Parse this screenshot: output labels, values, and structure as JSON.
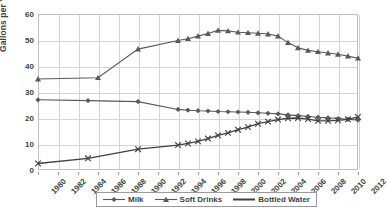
{
  "chart_data": {
    "type": "line",
    "title": "",
    "xlabel": "",
    "ylabel": "Gallons per Year",
    "xlim": [
      1980,
      2012
    ],
    "ylim": [
      0,
      60
    ],
    "y_ticks": [
      0,
      10,
      20,
      30,
      40,
      50,
      60
    ],
    "x_ticks": [
      1980,
      1982,
      1984,
      1986,
      1988,
      1990,
      1992,
      1994,
      1996,
      1998,
      2000,
      2002,
      2004,
      2006,
      2008,
      2010,
      2012
    ],
    "grid": true,
    "legend_position": "bottom-center",
    "series": [
      {
        "name": "Milk",
        "marker": "diamond",
        "color": "#595959",
        "x": [
          1980,
          1985,
          1990,
          1994,
          1995,
          1996,
          1997,
          1998,
          1999,
          2000,
          2001,
          2002,
          2003,
          2004,
          2005,
          2006,
          2007,
          2008,
          2009,
          2010,
          2011,
          2012
        ],
        "values": [
          27.0,
          26.7,
          26.3,
          23.3,
          23.0,
          22.8,
          22.7,
          22.5,
          22.4,
          22.3,
          22.2,
          22.0,
          21.8,
          21.6,
          21.2,
          20.9,
          20.6,
          20.3,
          20.1,
          19.8,
          19.5,
          19.2
        ]
      },
      {
        "name": "Soft Drinks",
        "marker": "triangle",
        "color": "#595959",
        "x": [
          1980,
          1986,
          1990,
          1994,
          1995,
          1996,
          1997,
          1998,
          1999,
          2000,
          2001,
          2002,
          2003,
          2004,
          2005,
          2006,
          2007,
          2008,
          2009,
          2010,
          2011,
          2012
        ],
        "values": [
          35.0,
          35.5,
          46.5,
          49.8,
          50.5,
          51.5,
          52.5,
          53.7,
          53.5,
          53.0,
          52.8,
          52.6,
          52.3,
          51.5,
          49.0,
          47.0,
          46.0,
          45.5,
          45.0,
          44.5,
          43.8,
          43.0
        ]
      },
      {
        "name": "Bottled Water",
        "marker": "cross",
        "color": "#404040",
        "x": [
          1980,
          1985,
          1990,
          1994,
          1995,
          1996,
          1997,
          1998,
          1999,
          2000,
          2001,
          2002,
          2003,
          2004,
          2005,
          2006,
          2007,
          2008,
          2009,
          2010,
          2011,
          2012
        ],
        "values": [
          2.5,
          4.5,
          8.0,
          9.6,
          10.2,
          11.0,
          12.1,
          13.3,
          14.3,
          15.5,
          16.5,
          17.8,
          18.6,
          19.4,
          19.9,
          20.0,
          19.6,
          18.9,
          18.9,
          19.1,
          19.5,
          20.4
        ]
      }
    ]
  },
  "legend": {
    "items": [
      {
        "label": "Milk",
        "marker": "diamond"
      },
      {
        "label": "Soft Drinks",
        "marker": "triangle"
      },
      {
        "label": "Bottled Water",
        "marker": "line"
      }
    ]
  }
}
